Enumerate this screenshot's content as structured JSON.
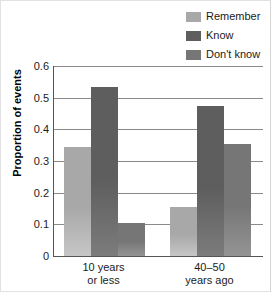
{
  "chart_data": {
    "type": "bar",
    "title": "",
    "xlabel": "",
    "ylabel": "Proportion of events",
    "ylim": [
      0,
      0.6
    ],
    "yticks": [
      "0",
      "0.1",
      "0.2",
      "0.3",
      "0.4",
      "0.5",
      "0.6"
    ],
    "ytick_values": [
      0,
      0.1,
      0.2,
      0.3,
      0.4,
      0.5,
      0.6
    ],
    "grid": true,
    "legend_position": "top-right",
    "categories": [
      "10 years\nor less",
      "40–50\nyears ago"
    ],
    "category_lines": [
      [
        "10 years",
        "or less"
      ],
      [
        "40–50",
        "years ago"
      ]
    ],
    "series": [
      {
        "name": "Remember",
        "color": "#a8a8a8",
        "values": [
          0.345,
          0.155
        ]
      },
      {
        "name": "Know",
        "color": "#5e5e5e",
        "values": [
          0.535,
          0.475
        ]
      },
      {
        "name": "Don't know",
        "color": "#767676",
        "values": [
          0.105,
          0.355
        ]
      }
    ]
  },
  "legend": {
    "items": [
      {
        "label": "Remember",
        "color": "#a8a8a8"
      },
      {
        "label": "Know",
        "color": "#5e5e5e"
      },
      {
        "label": "Don't know",
        "color": "#767676"
      }
    ]
  },
  "axis": {
    "y_title": "Proportion of events"
  }
}
